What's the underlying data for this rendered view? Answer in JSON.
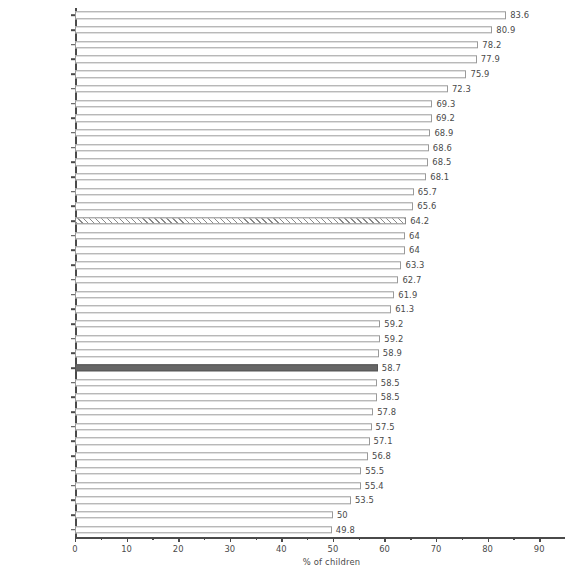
{
  "chart_data": {
    "type": "bar",
    "orientation": "horizontal",
    "title": "",
    "xlabel": "% of children",
    "ylabel": "",
    "xlim": [
      0,
      95
    ],
    "xticks": [
      0,
      10,
      20,
      30,
      40,
      50,
      60,
      70,
      80,
      90
    ],
    "xticklabels": [
      "0",
      "10",
      "20",
      "30",
      "40",
      "50",
      "60",
      "70",
      "80",
      "90"
    ],
    "grid": false,
    "legend": false,
    "categories": [
      "Slovenia",
      "Macedonia",
      "Netherlands",
      "Poland",
      "Hungary",
      "Sweden",
      "Croatia",
      "Israel",
      "Ukraine",
      "Russia",
      "France",
      "Greenland",
      "Finland",
      "Norway",
      "HBSC Average",
      "Scotland",
      "England",
      "Switzerland",
      "Portugal",
      "Spain",
      "Latvia",
      "Wales",
      "Denmark",
      "Italy",
      "Ireland",
      "Canada",
      "Austria",
      "Greece",
      "Germany",
      "Estonia",
      "Czech Republic",
      "Belgium (Flemish)",
      "USA",
      "Lithuania",
      "Malta",
      "Belgium (French)"
    ],
    "values": [
      83.6,
      80.9,
      78.2,
      77.9,
      75.9,
      72.3,
      69.3,
      69.2,
      68.9,
      68.6,
      68.5,
      68.1,
      65.7,
      65.6,
      64.2,
      64,
      64,
      63.3,
      62.7,
      61.9,
      61.3,
      59.2,
      59.2,
      58.9,
      58.7,
      58.5,
      58.5,
      57.8,
      57.5,
      57.1,
      56.8,
      55.5,
      55.4,
      53.5,
      50,
      49.8
    ],
    "value_labels": [
      "83.6",
      "80.9",
      "78.2",
      "77.9",
      "75.9",
      "72.3",
      "69.3",
      "69.2",
      "68.9",
      "68.6",
      "68.5",
      "68.1",
      "65.7",
      "65.6",
      "64.2",
      "64",
      "64",
      "63.3",
      "62.7",
      "61.9",
      "61.3",
      "59.2",
      "59.2",
      "58.9",
      "58.7",
      "58.5",
      "58.5",
      "57.8",
      "57.5",
      "57.1",
      "56.8",
      "55.5",
      "55.4",
      "53.5",
      "50",
      "49.8"
    ],
    "bar_styles": [
      "open",
      "open",
      "open",
      "open",
      "open",
      "open",
      "open",
      "open",
      "open",
      "open",
      "open",
      "open",
      "open",
      "open",
      "hatched",
      "open",
      "open",
      "open",
      "open",
      "open",
      "open",
      "open",
      "open",
      "open",
      "highlight",
      "open",
      "open",
      "open",
      "open",
      "open",
      "open",
      "open",
      "open",
      "open",
      "open",
      "open"
    ],
    "colors": {
      "bar_outline": "#9a9a9a",
      "bar_fill": "#ffffff",
      "highlight_fill": "#666666",
      "hatch_stroke": "#8a8a8a",
      "axis": "#4a4a4a",
      "text": "#4a4a4a",
      "background": "#ffffff"
    }
  }
}
